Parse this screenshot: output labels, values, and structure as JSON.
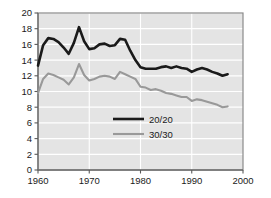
{
  "chart_data": {
    "type": "line",
    "title": "",
    "subtitle": "",
    "xlabel": "",
    "ylabel": "",
    "xlim": [
      1960,
      2000
    ],
    "ylim": [
      0,
      20
    ],
    "grid": true,
    "grid_orientation": "both",
    "legend_position": "center",
    "x_ticks": [
      "1960",
      "1970",
      "1980",
      "1990",
      "2000"
    ],
    "x_tick_values": [
      1960,
      1970,
      1980,
      1990,
      2000
    ],
    "y_ticks": [
      "0",
      "2",
      "4",
      "6",
      "8",
      "10",
      "12",
      "14",
      "16",
      "18",
      "20"
    ],
    "y_tick_values": [
      0,
      2,
      4,
      6,
      8,
      10,
      12,
      14,
      16,
      18,
      20
    ],
    "x": [
      1960,
      1961,
      1962,
      1963,
      1964,
      1965,
      1966,
      1967,
      1968,
      1969,
      1970,
      1971,
      1972,
      1973,
      1974,
      1975,
      1976,
      1977,
      1978,
      1979,
      1980,
      1981,
      1982,
      1983,
      1984,
      1985,
      1986,
      1987,
      1988,
      1989,
      1990,
      1991,
      1992,
      1993,
      1994,
      1995,
      1996,
      1997
    ],
    "series": [
      {
        "name": "20/20",
        "color": "#1a1a1a",
        "line_width": 2.6,
        "values": [
          13.3,
          15.9,
          16.8,
          16.7,
          16.3,
          15.6,
          14.8,
          16.2,
          18.2,
          16.4,
          15.4,
          15.5,
          16.0,
          16.1,
          15.8,
          15.9,
          16.7,
          16.6,
          15.2,
          14.0,
          13.1,
          12.9,
          12.9,
          12.9,
          13.1,
          13.2,
          13.0,
          13.2,
          13.0,
          12.9,
          12.5,
          12.8,
          13.0,
          12.8,
          12.5,
          12.3,
          12.0,
          12.2
        ]
      },
      {
        "name": "30/30",
        "color": "#999999",
        "line_width": 2.1,
        "values": [
          9.8,
          11.6,
          12.3,
          12.1,
          11.8,
          11.5,
          10.9,
          11.8,
          13.5,
          12.1,
          11.4,
          11.6,
          11.9,
          12.0,
          11.9,
          11.6,
          12.5,
          12.2,
          11.9,
          11.6,
          10.6,
          10.5,
          10.2,
          10.3,
          10.1,
          9.8,
          9.7,
          9.5,
          9.3,
          9.3,
          8.8,
          9.0,
          8.9,
          8.7,
          8.5,
          8.3,
          8.0,
          8.1
        ]
      }
    ],
    "legend_entries": [
      {
        "label": "20/20",
        "color": "#1a1a1a"
      },
      {
        "label": "30/30",
        "color": "#999999"
      }
    ],
    "style": {
      "plot_background": "#e4e4e4",
      "gridline_color": "#ffffff",
      "axis_color": "#7a7a7a",
      "tick_label_color": "#1a1a1a",
      "page_background": "#ffffff"
    }
  }
}
